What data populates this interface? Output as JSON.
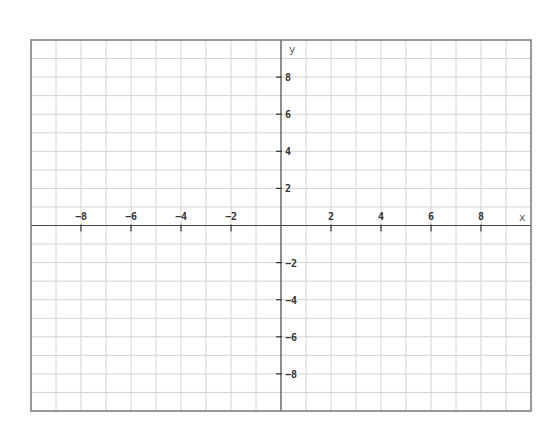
{
  "chart_data": {
    "type": "line",
    "title": "",
    "xlabel": "x",
    "ylabel": "y",
    "xlim": [
      -10,
      10
    ],
    "ylim": [
      -10,
      10
    ],
    "grid": true,
    "grid_step": 1,
    "series": [],
    "x_ticks": [
      -8,
      -6,
      -4,
      -2,
      2,
      4,
      6,
      8
    ],
    "y_ticks": [
      8,
      6,
      4,
      2,
      -2,
      -4,
      -6,
      -8
    ],
    "x_tick_labels": [
      "−8",
      "−6",
      "−4",
      "−2",
      "2",
      "4",
      "6",
      "8"
    ],
    "y_tick_labels": [
      "8",
      "6",
      "4",
      "2",
      "−2",
      "−4",
      "−6",
      "−8"
    ]
  },
  "colors": {
    "frame": "#777777",
    "grid": "#d4d4d4",
    "axis": "#444444",
    "tick": "#333333"
  },
  "layout": {
    "left": 31,
    "top": 40,
    "right": 531,
    "bottom": 411
  }
}
